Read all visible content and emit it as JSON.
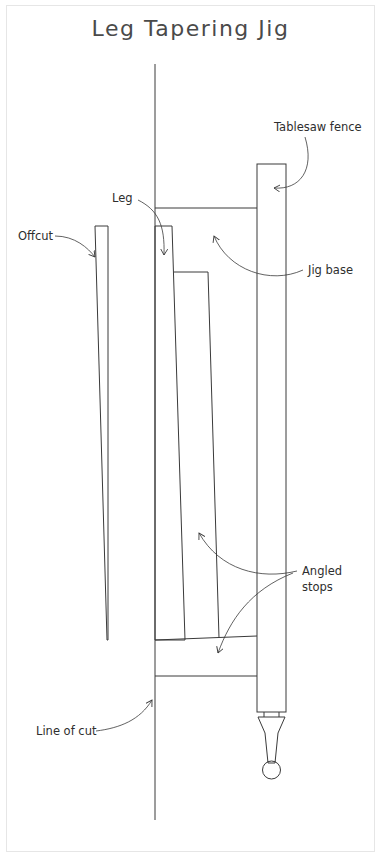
{
  "title": "Leg Tapering Jig",
  "labels": {
    "tablesaw_fence": "Tablesaw fence",
    "leg": "Leg",
    "offcut": "Offcut",
    "jig_base": "Jig base",
    "angled_stops_line1": "Angled",
    "angled_stops_line2": "stops",
    "line_of_cut": "Line of cut"
  },
  "colors": {
    "line": "#3a3a3a",
    "text": "#2e2e2e",
    "title": "#4a4a4a",
    "frame": "#e6e6e6"
  }
}
